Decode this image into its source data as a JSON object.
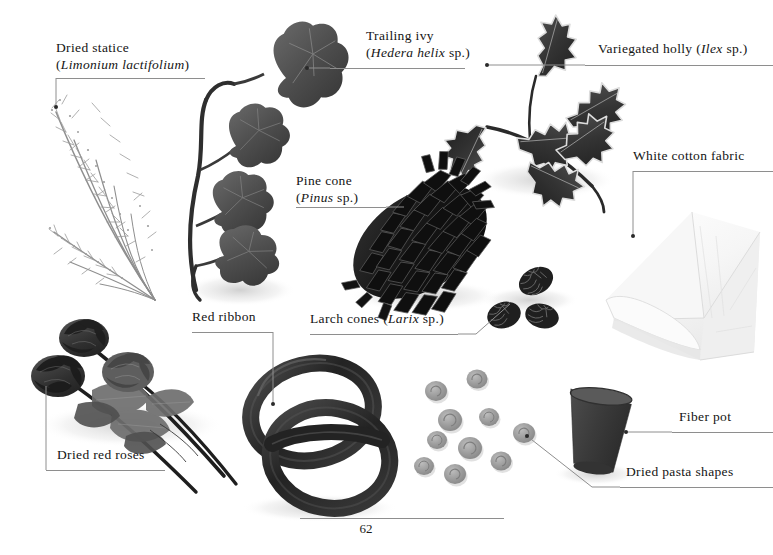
{
  "page": {
    "number": "62",
    "background_color": "#ffffff",
    "rule_color": "#8e8e8e",
    "text_color": "#141414"
  },
  "labels": {
    "dried_statice": {
      "line1": "Dried statice",
      "genus": "Limonium lactifolium",
      "line2_open": "(",
      "line2_close": ")"
    },
    "trailing_ivy": {
      "line1": "Trailing ivy",
      "genus": "Hedera helix",
      "suffix": " sp.",
      "open": "(",
      "close": ")"
    },
    "variegated_holly": {
      "prefix": "Variegated holly (",
      "genus": "Ilex",
      "suffix": " sp.",
      "close": ")"
    },
    "pine_cone": {
      "line1": "Pine cone",
      "genus": "Pinus",
      "suffix": " sp.",
      "open": "(",
      "close": ")"
    },
    "white_cotton_fabric": {
      "text": "White cotton fabric"
    },
    "red_ribbon": {
      "text": "Red ribbon"
    },
    "larch_cones": {
      "prefix": "Larch cones (",
      "genus": "Larix",
      "suffix": " sp.",
      "close": ")"
    },
    "dried_red_roses": {
      "text": "Dried red roses"
    },
    "fiber_pot": {
      "text": "Fiber pot"
    },
    "dried_pasta_shapes": {
      "text": "Dried pasta shapes"
    }
  },
  "specimens": {
    "dried_statice": {
      "name": "dried statice sprays",
      "tone": "#9a9a9a"
    },
    "trailing_ivy": {
      "name": "trailing ivy vine",
      "tone": "#4a4a4a"
    },
    "variegated_holly": {
      "name": "variegated holly sprig",
      "tone": "#3c3c3c"
    },
    "pine_cone": {
      "name": "pine cone",
      "tone": "#1c1c1c"
    },
    "larch_cones": {
      "name": "larch cones",
      "count": 3,
      "tone": "#262626"
    },
    "white_cotton_fabric": {
      "name": "folded white cotton fabric",
      "tone": "#f2f2f2"
    },
    "dried_red_roses": {
      "name": "dried red roses",
      "count": 3,
      "tone": "#3a3a3a"
    },
    "red_ribbon": {
      "name": "red ribbon loops",
      "tone": "#2b2b2b"
    },
    "dried_pasta_shapes": {
      "name": "dried pasta rounds",
      "count": 10,
      "tone": "#9d9d9d"
    },
    "fiber_pot": {
      "name": "fiber pot",
      "tone": "#3f3f3f"
    }
  }
}
